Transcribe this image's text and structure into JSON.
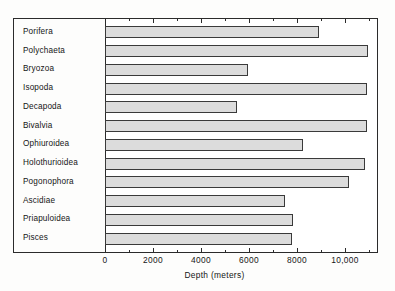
{
  "chart_data": {
    "type": "bar",
    "orientation": "horizontal",
    "title": "",
    "xlabel": "Depth (meters)",
    "ylabel": "",
    "xlim": [
      0,
      11375
    ],
    "xticks": [
      0,
      2000,
      4000,
      6000,
      8000,
      10000
    ],
    "xticklabels": [
      "0",
      "2000",
      "4000",
      "6000",
      "8000",
      "10,000"
    ],
    "minor_tick_interval": 1000,
    "grid": false,
    "legend": false,
    "categories": [
      "Porifera",
      "Polychaeta",
      "Bryozoa",
      "Isopoda",
      "Decapoda",
      "Bivalvia",
      "Ophiuroidea",
      "Holothurioidea",
      "Pogonophora",
      "Ascidiae",
      "Priapuloidea",
      "Pisces"
    ],
    "values": [
      8900,
      10950,
      5950,
      10900,
      5500,
      10900,
      8250,
      10850,
      10150,
      7500,
      7850,
      7800
    ],
    "bar_fill_color": "#dcdcdc",
    "bar_edge_color": "#3a3a3a",
    "axis_color": "#2b2b2b"
  }
}
